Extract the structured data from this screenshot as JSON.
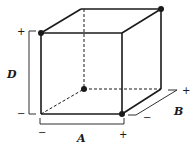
{
  "diagram": {
    "type": "cube-design-factor-space",
    "factors": [
      {
        "name": "A",
        "low": "−",
        "high": "+"
      },
      {
        "name": "B",
        "low": "−",
        "high": "+"
      },
      {
        "name": "D",
        "low": "−",
        "high": "+"
      }
    ],
    "labels": {
      "A": "A",
      "B": "B",
      "D": "D"
    },
    "signs": {
      "D_high": "+",
      "D_low": "−",
      "A_low": "−",
      "A_high": "+",
      "B_low": "−",
      "B_high": "+"
    },
    "highlighted_vertices": [
      {
        "position": "front-top-left",
        "A": "−",
        "B": "−",
        "D": "+"
      },
      {
        "position": "back-top-right",
        "A": "+",
        "B": "+",
        "D": "+"
      },
      {
        "position": "front-bottom-right",
        "A": "+",
        "B": "−",
        "D": "−"
      },
      {
        "position": "back-bottom-left",
        "A": "−",
        "B": "+",
        "D": "−"
      }
    ],
    "colors": {
      "line": "#1a1a1a",
      "background": "#ffffff"
    }
  }
}
